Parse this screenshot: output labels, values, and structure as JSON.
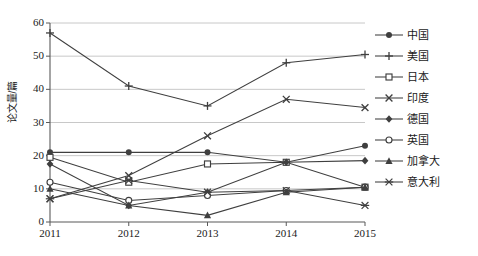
{
  "chart_data": {
    "type": "line",
    "title": "",
    "xlabel": "",
    "ylabel": "论文量/篇",
    "categories": [
      "2011",
      "2012",
      "2013",
      "2014",
      "2015"
    ],
    "x_ticks": [
      "2011",
      "2012",
      "2013",
      "2014",
      "2015"
    ],
    "y_ticks": [
      "0",
      "10",
      "20",
      "30",
      "40",
      "50",
      "60"
    ],
    "ylim": [
      0,
      60
    ],
    "grid": "horizontal",
    "legend_position": "right",
    "series": [
      {
        "name": "中国",
        "marker": "filled-circle",
        "values": [
          21,
          21,
          21,
          18,
          23
        ]
      },
      {
        "name": "美国",
        "marker": "plus",
        "values": [
          57,
          41,
          35,
          48,
          50.5
        ]
      },
      {
        "name": "日本",
        "marker": "open-square",
        "values": [
          19.5,
          12,
          17.5,
          18,
          10.5
        ]
      },
      {
        "name": "印度",
        "marker": "cross",
        "values": [
          7,
          14,
          26,
          37,
          34.5
        ]
      },
      {
        "name": "德国",
        "marker": "filled-diamond",
        "values": [
          17.5,
          5,
          9,
          18,
          18.5
        ]
      },
      {
        "name": "英国",
        "marker": "open-circle",
        "values": [
          12,
          6.5,
          8,
          9.5,
          10.5
        ]
      },
      {
        "name": "加拿大",
        "marker": "filled-triangle",
        "values": [
          10,
          5,
          2,
          9,
          10.5
        ]
      },
      {
        "name": "意大利",
        "marker": "asterisk",
        "values": [
          7,
          12.5,
          9,
          9.5,
          5
        ]
      }
    ]
  },
  "legend": {
    "items": [
      {
        "label": "中国"
      },
      {
        "label": "美国"
      },
      {
        "label": "日本"
      },
      {
        "label": "印度"
      },
      {
        "label": "德国"
      },
      {
        "label": "英国"
      },
      {
        "label": "加拿大"
      },
      {
        "label": "意大利"
      }
    ]
  },
  "style": {
    "line_color": "#3f3f3f",
    "grid_color": "#c8c8c8",
    "axis_color": "#595959",
    "text_color": "#1a1a1a"
  }
}
